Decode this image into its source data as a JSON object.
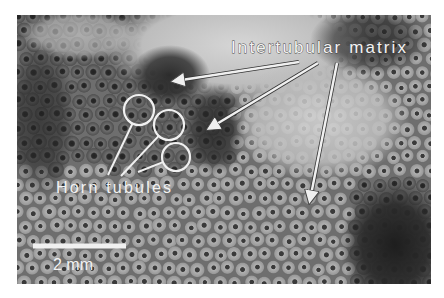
{
  "figure": {
    "type": "grayscale micrograph",
    "frame": {
      "x": 17,
      "y": 15,
      "width": 414,
      "height": 269
    }
  },
  "annotations": {
    "intertubular_label": {
      "text": "Intertubular matrix",
      "x": 231,
      "y": 53,
      "font_size": 17
    },
    "horn_label": {
      "text": "Horn tubules",
      "x": 56,
      "y": 193,
      "font_size": 16
    },
    "scale_bar": {
      "label": "2 mm",
      "x1": 33,
      "x2": 126,
      "y": 246,
      "thickness": 5,
      "label_x": 53,
      "label_y": 270,
      "font_size": 16
    },
    "arrows": [
      {
        "from": [
          299,
          62
        ],
        "to": [
          175,
          81
        ]
      },
      {
        "from": [
          318,
          63
        ],
        "to": [
          210,
          128
        ]
      },
      {
        "from": [
          337,
          63
        ],
        "to": [
          310,
          200
        ]
      }
    ],
    "circles": [
      {
        "cx": 139,
        "cy": 110,
        "r": 15,
        "line_to": [
          108,
          175
        ]
      },
      {
        "cx": 169,
        "cy": 125,
        "r": 15,
        "line_to": [
          121,
          176
        ]
      },
      {
        "cx": 176,
        "cy": 157,
        "r": 14,
        "line_to": [
          138,
          172
        ]
      }
    ]
  },
  "colors": {
    "annotation": "#f0f0f0",
    "outline": "#333333",
    "bright_region": "#c9c9c9",
    "dark_region": "#2e2e2e",
    "mid_region": "#7a7a7a"
  }
}
